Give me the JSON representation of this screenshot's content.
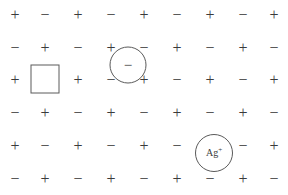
{
  "figure": {
    "name": "ionic-crystal-lattice-defects",
    "width": 288,
    "height": 195,
    "background_color": "#ffffff",
    "ion_color": "#3b3b3b",
    "outline_color": "#5a5a5a"
  },
  "lattice": {
    "columns": 9,
    "rows": 6,
    "column_x": [
      15,
      45,
      78,
      111,
      144,
      177,
      210,
      243,
      274
    ],
    "row_y": [
      15,
      48,
      80,
      113,
      146,
      179
    ],
    "cation_symbol": "+",
    "anion_symbol": "−",
    "grid": [
      [
        "+",
        "−",
        "+",
        "−",
        "+",
        "−",
        "+",
        "−",
        "+"
      ],
      [
        "−",
        "+",
        "−",
        "+",
        "−",
        "+",
        "−",
        "+",
        "−"
      ],
      [
        "+",
        null,
        "+",
        "−",
        "+",
        "−",
        "+",
        "−",
        "+"
      ],
      [
        "−",
        "+",
        "−",
        "+",
        "−",
        "+",
        "−",
        "+",
        "−"
      ],
      [
        "+",
        "−",
        "+",
        "−",
        "+",
        "−",
        null,
        "−",
        "+"
      ],
      [
        "−",
        "+",
        "−",
        "+",
        "−",
        "+",
        "−",
        "+",
        "−"
      ]
    ]
  },
  "defects": {
    "vacancy": {
      "name": "vacancy-square",
      "shape": "square",
      "label": "",
      "x": 45,
      "y": 79,
      "size": 29
    },
    "interstitial_anion": {
      "name": "interstitial-anion-circle",
      "shape": "circle",
      "label": "−",
      "x": 128,
      "y": 65,
      "diameter": 37
    },
    "silver_ion": {
      "name": "silver-ion-circle",
      "shape": "circle",
      "label_base": "Ag",
      "label_superscript": "+",
      "x": 214,
      "y": 153,
      "diameter": 38
    }
  }
}
